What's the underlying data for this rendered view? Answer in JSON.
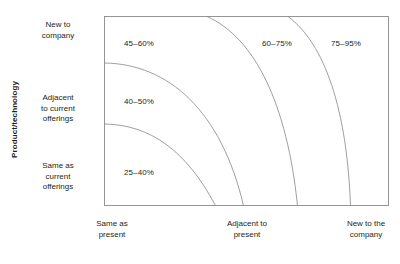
{
  "chart_data": {
    "type": "heatmap",
    "title": "PROBABILITY OF FAILURE",
    "xlabel": "",
    "ylabel": "Product/technology",
    "grid": false,
    "legend": "none",
    "x_categories": [
      "Same as present",
      "Adjacent to present",
      "New to the company"
    ],
    "y_categories": [
      "New to company",
      "Adjacent to current offerings",
      "Same as current offerings"
    ],
    "bands": [
      {
        "label": "25–40%",
        "low": 25,
        "high": 40,
        "region": "bottom-left innermost arc"
      },
      {
        "label": "40–50%",
        "low": 40,
        "high": 50,
        "region": "second arc band"
      },
      {
        "label": "45–60%",
        "low": 45,
        "high": 60,
        "region": "third arc band"
      },
      {
        "label": "60–75%",
        "low": 60,
        "high": 75,
        "region": "fourth arc band"
      },
      {
        "label": "75–95%",
        "low": 75,
        "high": 95,
        "region": "outermost top-right band"
      }
    ],
    "values": [
      25,
      40,
      45,
      60,
      75
    ],
    "categories": [
      "25–40%",
      "40–50%",
      "45–60%",
      "60–75%",
      "75–95%"
    ],
    "ylim": [
      0,
      100
    ]
  },
  "figure": {
    "title": "PROBABILITY OF FAILURE",
    "y_axis_title": "Product/technology",
    "y_categories": [
      "New to\ncompany",
      "Adjacent\nto current\nofferings",
      "Same as\ncurrent\nofferings"
    ],
    "x_categories": [
      "Same as\npresent",
      "Adjacent to\npresent",
      "New to the\ncompany"
    ],
    "band_labels": [
      "25–40%",
      "40–50%",
      "45–60%",
      "60–75%",
      "75–95%"
    ],
    "colors": {
      "frame_stroke": "#8a8a8a",
      "curve_stroke": "#8e8e8e",
      "text": "#231f20",
      "background": "#ffffff"
    }
  }
}
